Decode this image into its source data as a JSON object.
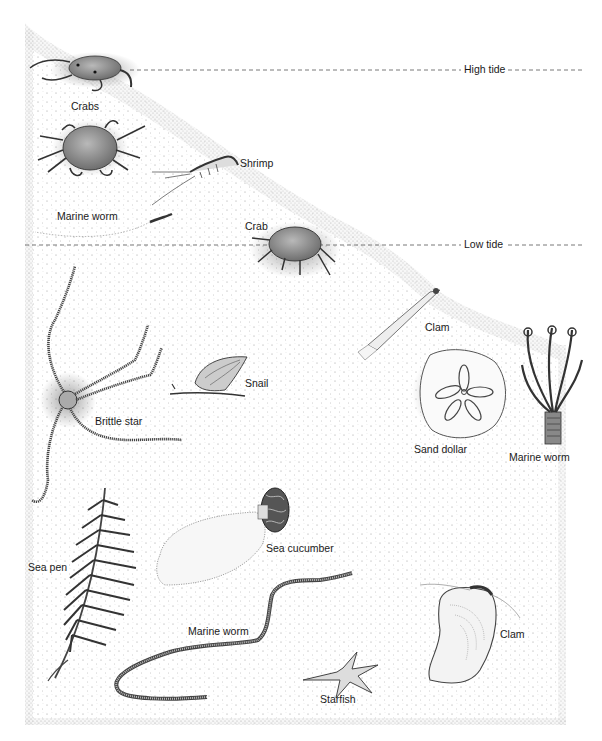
{
  "diagram": {
    "type": "illustration"
  },
  "tide_lines": {
    "high": {
      "label": "High tide",
      "y": 70
    },
    "low": {
      "label": "Low tide",
      "y": 245
    }
  },
  "organisms": [
    {
      "id": "crabs",
      "label": "Crabs",
      "zone": "intertidal",
      "x": 71,
      "y": 100
    },
    {
      "id": "shrimp",
      "label": "Shrimp",
      "zone": "intertidal",
      "x": 240,
      "y": 157
    },
    {
      "id": "marine-worm-1",
      "label": "Marine worm",
      "zone": "intertidal",
      "x": 57,
      "y": 210
    },
    {
      "id": "crab",
      "label": "Crab",
      "zone": "low-tide",
      "x": 245,
      "y": 220
    },
    {
      "id": "clam-1",
      "label": "Clam",
      "zone": "subtidal",
      "x": 425,
      "y": 321
    },
    {
      "id": "snail",
      "label": "Snail",
      "zone": "subtidal",
      "x": 245,
      "y": 377
    },
    {
      "id": "brittle-star",
      "label": "Brittle star",
      "zone": "subtidal",
      "x": 95,
      "y": 415
    },
    {
      "id": "sand-dollar",
      "label": "Sand dollar",
      "zone": "subtidal",
      "x": 414,
      "y": 443
    },
    {
      "id": "marine-worm-2",
      "label": "Marine worm",
      "zone": "subtidal",
      "x": 509,
      "y": 451
    },
    {
      "id": "sea-cucumber",
      "label": "Sea cucumber",
      "zone": "subtidal",
      "x": 266,
      "y": 542
    },
    {
      "id": "sea-pen",
      "label": "Sea pen",
      "zone": "subtidal",
      "x": 28,
      "y": 561
    },
    {
      "id": "marine-worm-3",
      "label": "Marine worm",
      "zone": "subtidal",
      "x": 188,
      "y": 625
    },
    {
      "id": "clam-2",
      "label": "Clam",
      "zone": "subtidal",
      "x": 500,
      "y": 628
    },
    {
      "id": "starfish",
      "label": "Starfish",
      "zone": "subtidal",
      "x": 320,
      "y": 693
    }
  ]
}
